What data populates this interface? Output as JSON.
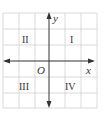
{
  "diagram": {
    "axes": {
      "x_label": "x",
      "y_label": "y",
      "origin_label": "O"
    },
    "quadrants": [
      {
        "label": "I",
        "position": "upper-right"
      },
      {
        "label": "II",
        "position": "upper-left"
      },
      {
        "label": "III",
        "position": "lower-left"
      },
      {
        "label": "IV",
        "position": "lower-right"
      }
    ],
    "grid": {
      "columns": 6,
      "rows": 6
    },
    "colors": {
      "grid": "#cfcfcf",
      "axis": "#333333",
      "background": "#ffffff"
    }
  }
}
